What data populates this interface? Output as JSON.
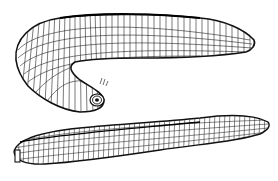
{
  "figure": {
    "style": "black ink line engraving on white",
    "background_color": "#ffffff",
    "ink_color": "#111111",
    "specimens": [
      {
        "name": "curled-leech",
        "view": "dorsal, body curving down with posterior sucker visible"
      },
      {
        "name": "extended-leech",
        "view": "lateral, fully extended body"
      }
    ]
  }
}
